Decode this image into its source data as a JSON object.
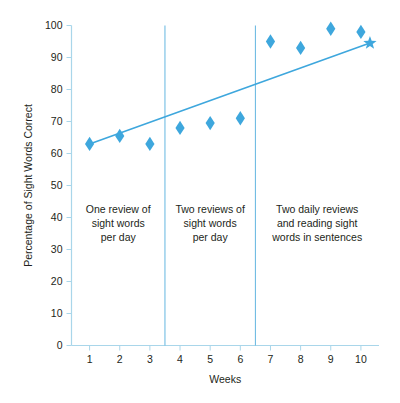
{
  "chart_data": {
    "type": "scatter",
    "title": "",
    "xlabel": "Weeks",
    "ylabel": "Percentage of Sight Words Correct",
    "xlim": [
      0.4,
      10.6
    ],
    "ylim": [
      0,
      100
    ],
    "grid": false,
    "legend": "none",
    "x_ticks": [
      "1",
      "2",
      "3",
      "4",
      "5",
      "6",
      "7",
      "8",
      "9",
      "10"
    ],
    "x_tick_values": [
      1,
      2,
      3,
      4,
      5,
      6,
      7,
      8,
      9,
      10
    ],
    "y_ticks": [
      "0",
      "10",
      "20",
      "30",
      "40",
      "50",
      "60",
      "70",
      "80",
      "90",
      "100"
    ],
    "y_tick_values": [
      0,
      10,
      20,
      30,
      40,
      50,
      60,
      70,
      80,
      90,
      100
    ],
    "x": [
      1,
      2,
      3,
      4,
      5,
      6,
      7,
      8,
      9,
      10
    ],
    "values": [
      63,
      65.5,
      63,
      68,
      69.5,
      71,
      95,
      93,
      99,
      98
    ],
    "series": [
      {
        "name": "Percentage of sight words correct",
        "marker": "diamond",
        "color": "#3ea7dd",
        "x": [
          1,
          2,
          3,
          4,
          5,
          6,
          7,
          8,
          9,
          10
        ],
        "values": [
          63,
          65.5,
          63,
          68,
          69.5,
          71,
          95,
          93,
          99,
          98
        ]
      },
      {
        "name": "Trend line",
        "marker": "line",
        "color": "#3ea7dd",
        "x": [
          1,
          10.3
        ],
        "values": [
          63,
          94.5
        ],
        "endpoint_marker": "star"
      }
    ],
    "annotations": [
      {
        "name": "phase-1",
        "x_range": [
          0.4,
          3.5
        ],
        "text": "One review of sight words per day",
        "lines": [
          "One review of",
          "sight words",
          "per day"
        ]
      },
      {
        "name": "phase-2",
        "x_range": [
          3.5,
          6.5
        ],
        "text": "Two reviews of sight words per day",
        "lines": [
          "Two reviews of",
          "sight words",
          "per day"
        ]
      },
      {
        "name": "phase-3",
        "x_range": [
          6.5,
          10.6
        ],
        "text": "Two daily reviews and reading sight words in sentences",
        "lines": [
          "Two daily reviews",
          "and reading sight",
          "words in sentences"
        ]
      }
    ],
    "phase_dividers": [
      3.5,
      6.5
    ],
    "colors": {
      "marker": "#3ea7dd",
      "trend": "#3ea7dd",
      "axis": "#a9d6ea",
      "phase_divider": "#63b6e0",
      "text": "#231f20",
      "background": "#ffffff"
    }
  }
}
